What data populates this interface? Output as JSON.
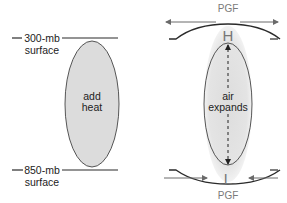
{
  "left_panel": {
    "upper_label_line1": "300-mb",
    "upper_label_line2": "surface",
    "lower_label_line1": "850-mb",
    "lower_label_line2": "surface",
    "column_label_line1": "add",
    "column_label_line2": "heat"
  },
  "right_panel": {
    "top_force_label": "PGF",
    "high_pressure_label": "H",
    "low_pressure_label": "L",
    "column_label_line1": "air",
    "column_label_line2": "expands",
    "bottom_force_label": "PGF"
  },
  "colors": {
    "line": "#2a2a2a",
    "ellipse_fill": "#dcdcdc",
    "column_shade": "#e2e2e2",
    "arrow_gray": "#6a6a6a",
    "label_gray": "#7a7a7a",
    "text": "#222222"
  }
}
